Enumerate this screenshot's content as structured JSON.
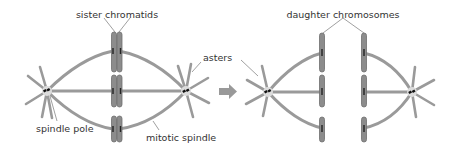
{
  "labels": {
    "sister_chromatids": "sister chromatids",
    "daughter_chromosomes": "daughter chromosomes",
    "asters": "asters",
    "spindle_pole": "spindle pole",
    "mitotic_spindle": "mitotic spindle"
  },
  "colors": {
    "fiber": "#9a9a9a",
    "chromosome": "#8c8c8c",
    "arrow": "#999999",
    "text": "#333333",
    "centriole": "#111111"
  },
  "panels": [
    {
      "name": "metaphase",
      "description": "sister chromatids aligned at the spindle equator"
    },
    {
      "name": "anaphase",
      "description": "daughter chromosomes pulled toward opposite spindle poles"
    }
  ]
}
